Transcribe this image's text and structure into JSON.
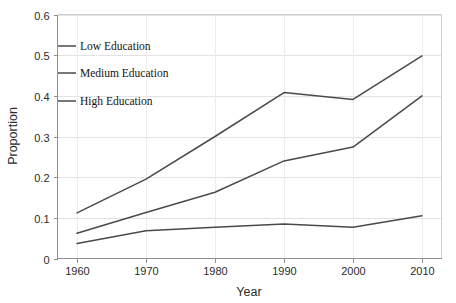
{
  "chart_data": {
    "type": "line",
    "title": "",
    "subtitle": "",
    "xlabel": "Year",
    "ylabel": "Proportion",
    "categories": [
      1960,
      1970,
      1980,
      1990,
      2000,
      2010
    ],
    "xtick_labels": [
      "1960",
      "1970",
      "1980",
      "1990",
      "2000",
      "2010"
    ],
    "ytick_labels": [
      "0",
      "0.1",
      "0.2",
      "0.3",
      "0.4",
      "0.5",
      "0.6"
    ],
    "ytick_values": [
      0,
      0.1,
      0.2,
      0.3,
      0.4,
      0.5,
      0.6
    ],
    "ylim": [
      0,
      0.6
    ],
    "xlim": [
      1960,
      2010
    ],
    "grid": "horizontal",
    "legend_position": "inside-upper-left",
    "series": [
      {
        "name": "Low Education",
        "color": "#4a4a4a",
        "values": [
          0.112,
          0.195,
          0.3,
          0.408,
          0.391,
          0.498
        ]
      },
      {
        "name": "Medium Education",
        "color": "#4a4a4a",
        "values": [
          0.062,
          0.113,
          0.163,
          0.24,
          0.274,
          0.4
        ]
      },
      {
        "name": "High Education",
        "color": "#4a4a4a",
        "values": [
          0.037,
          0.068,
          0.077,
          0.085,
          0.077,
          0.105
        ]
      }
    ]
  },
  "legend": {
    "items": [
      {
        "label": "Low Education"
      },
      {
        "label": "Medium Education"
      },
      {
        "label": "High Education"
      }
    ]
  },
  "axes": {
    "x_title": "Year",
    "y_title": "Proportion"
  },
  "colors": {
    "line": "#4a4a4a",
    "gridline": "#e2e2e2",
    "frame": "#cfcfcf",
    "axis": "#8f8f8f",
    "background": "#ffffff",
    "text": "#2b2b2b"
  }
}
